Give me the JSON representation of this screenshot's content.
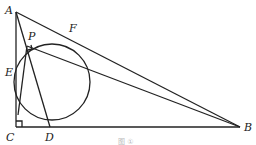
{
  "diagram": {
    "points": {
      "A": {
        "label": "A",
        "x": 16,
        "y": 12
      },
      "B": {
        "label": "B",
        "x": 240,
        "y": 127
      },
      "C": {
        "label": "C",
        "x": 16,
        "y": 127
      },
      "D": {
        "label": "D",
        "x": 50,
        "y": 127
      },
      "E": {
        "label": "E",
        "x": 16,
        "y": 72
      },
      "F": {
        "label": "F",
        "x": 72,
        "y": 35
      },
      "P": {
        "label": "P",
        "x": 27,
        "y": 46
      }
    },
    "circle": {
      "cx": 52,
      "cy": 82,
      "r": 38
    },
    "segments": [
      "AC",
      "CB",
      "AB",
      "AD",
      "PB",
      "EP"
    ],
    "right_angles": [
      "C",
      "P"
    ],
    "caption": "图 ①"
  }
}
